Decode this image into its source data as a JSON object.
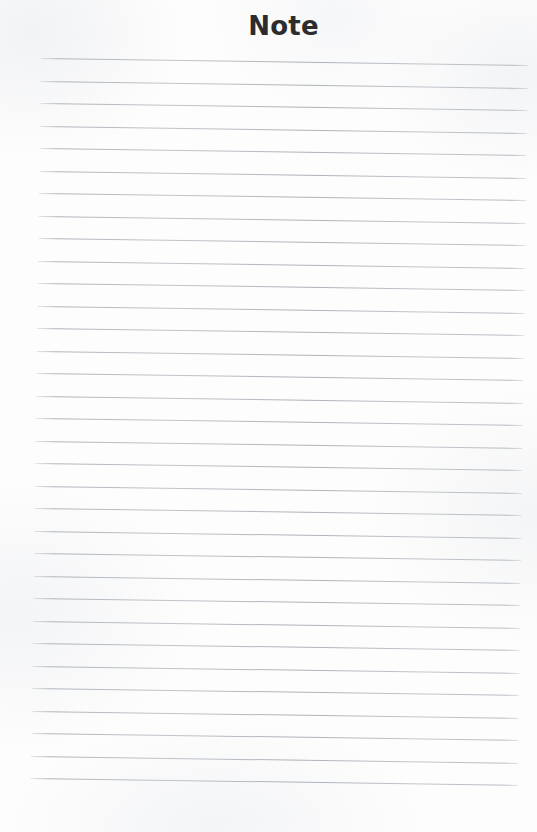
{
  "document": {
    "title": "Note",
    "type": "lined-note-page",
    "background_color": "#fdfdfd",
    "title_color": "#2c2c2e",
    "rule_line_color": "#adb2b9",
    "rule_line_count": 33,
    "rule_line_spacing_px": 22.5,
    "rule_line_left_px": 41,
    "rule_line_right_px": 528,
    "first_rule_line_top_px": 58,
    "page_width_px": 537,
    "page_height_px": 832,
    "skew_degrees": 0.82,
    "body_text": ""
  }
}
